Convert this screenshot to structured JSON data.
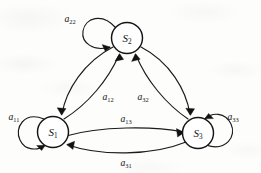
{
  "figure": {
    "type": "state-transition-diagram",
    "background_color": "#fdfdfc",
    "stroke_color": "#1b1b1b"
  },
  "nodes": [
    {
      "id": "S1",
      "label_base": "S",
      "label_sub": "1",
      "cx": 53,
      "cy": 132,
      "r": 15.5
    },
    {
      "id": "S2",
      "label_base": "S",
      "label_sub": "2",
      "cx": 127,
      "cy": 38,
      "r": 15.5
    },
    {
      "id": "S3",
      "label_base": "S",
      "label_sub": "3",
      "cx": 198,
      "cy": 133,
      "r": 15.5
    }
  ],
  "self_loops": [
    {
      "id": "a11",
      "from": "S1",
      "to": "S1",
      "label_base": "a",
      "label_sub": "11",
      "label_x": 14,
      "label_y": 120,
      "side": "left"
    },
    {
      "id": "a22",
      "from": "S2",
      "to": "S2",
      "label_base": "a",
      "label_sub": "22",
      "label_x": 70,
      "label_y": 22,
      "side": "upper-left"
    },
    {
      "id": "a33",
      "from": "S3",
      "to": "S3",
      "label_base": "a",
      "label_sub": "33",
      "label_x": 233,
      "label_y": 120,
      "side": "right"
    }
  ],
  "edges": [
    {
      "id": "a12",
      "from": "S1",
      "to": "S2",
      "label_base": "a",
      "label_sub": "12",
      "label_x": 108,
      "label_y": 100,
      "direction": "up"
    },
    {
      "id": "a21",
      "from": "S2",
      "to": "S1",
      "label_base": "",
      "label_sub": "",
      "direction": "down"
    },
    {
      "id": "a32",
      "from": "S3",
      "to": "S2",
      "label_base": "a",
      "label_sub": "32",
      "label_x": 143,
      "label_y": 100,
      "direction": "up"
    },
    {
      "id": "a23",
      "from": "S2",
      "to": "S3",
      "label_base": "",
      "label_sub": "",
      "direction": "down"
    },
    {
      "id": "a13",
      "from": "S1",
      "to": "S3",
      "label_base": "a",
      "label_sub": "13",
      "label_x": 126,
      "label_y": 122,
      "direction": "right"
    },
    {
      "id": "a31",
      "from": "S3",
      "to": "S1",
      "label_base": "a",
      "label_sub": "31",
      "label_x": 126,
      "label_y": 166,
      "direction": "left"
    }
  ]
}
